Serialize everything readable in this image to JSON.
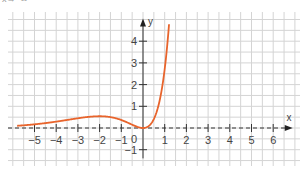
{
  "caption": "x→−∞",
  "chart_data": {
    "type": "line",
    "title": "",
    "function": "f(x) = x^2 * e^x",
    "xlabel": "x",
    "ylabel": "y",
    "xlim": [
      -6,
      7
    ],
    "ylim": [
      -1.5,
      5
    ],
    "grid": true,
    "x_ticks": [
      -5,
      -4,
      -3,
      -2,
      -1,
      1,
      2,
      3,
      4,
      5,
      6
    ],
    "x_tick_labels": [
      "−5",
      "−4",
      "−3",
      "−2",
      "−1",
      "1",
      "2",
      "3",
      "4",
      "5",
      "6"
    ],
    "y_ticks": [
      1,
      2,
      3,
      4,
      -1
    ],
    "y_tick_labels": [
      "1",
      "2",
      "3",
      "4",
      "−1"
    ],
    "origin_label": "0",
    "series": [
      {
        "name": "f",
        "color": "#e8642c",
        "x": [
          -5.8,
          -5,
          -4,
          -3,
          -2.5,
          -2,
          -1.5,
          -1,
          -0.5,
          0,
          0.5,
          0.8,
          1,
          1.1,
          1.2
        ],
        "y": [
          0.1,
          0.17,
          0.29,
          0.45,
          0.51,
          0.54,
          0.5,
          0.37,
          0.15,
          0,
          0.41,
          1.42,
          2.72,
          3.64,
          4.78
        ]
      }
    ]
  }
}
